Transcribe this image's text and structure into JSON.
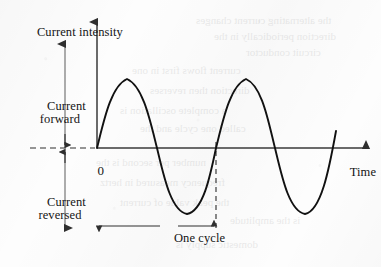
{
  "figure": {
    "title_axis_y": "Current\nintensity",
    "axis_x_label": "Time",
    "origin_label": "0",
    "region_forward": "Current\nforward",
    "region_reversed": "Current\nreversed",
    "cycle_label": "One cycle",
    "ink_color": "#141414",
    "axis_color": "#3a3a3a",
    "curve_color": "#111111",
    "paper_color": "#fdfdfd"
  },
  "chart_data": {
    "type": "line",
    "title": "Current intensity",
    "xlabel": "Time",
    "ylabel": "Current intensity",
    "x": [
      0,
      0.125,
      0.25,
      0.375,
      0.5,
      0.625,
      0.75,
      0.875,
      1.0,
      1.125,
      1.25,
      1.375,
      1.5,
      1.625,
      1.75,
      1.875,
      2.0
    ],
    "series": [
      {
        "name": "alternating current",
        "values": [
          0,
          0.707,
          1.0,
          0.707,
          0,
          -0.707,
          -1.0,
          -0.707,
          0,
          0.707,
          1.0,
          0.707,
          0,
          -0.707,
          -1.0,
          -0.707,
          0
        ]
      }
    ],
    "ylim": [
      -1.25,
      1.25
    ],
    "xlim": [
      0,
      2.05
    ],
    "grid": false,
    "legend": "none",
    "annotations": [
      {
        "text": "Current forward",
        "region": "above-axis"
      },
      {
        "text": "Current reversed",
        "region": "below-axis"
      },
      {
        "text": "One cycle",
        "from_x": 0,
        "to_x": 1.0
      },
      {
        "text": "0",
        "at": "origin"
      },
      {
        "text": "Time",
        "at": "x-axis-end"
      }
    ]
  },
  "ghost": {
    "lines": [
      {
        "text": "the alternating current changes",
        "x": 196,
        "y": 14
      },
      {
        "text": "direction periodically in the",
        "x": 214,
        "y": 30
      },
      {
        "text": "circuit conductor",
        "x": 246,
        "y": 46
      },
      {
        "text": "current flows first in one",
        "x": 132,
        "y": 64
      },
      {
        "text": "direction then reverses",
        "x": 150,
        "y": 84
      },
      {
        "text": "a complete oscillation is",
        "x": 120,
        "y": 104
      },
      {
        "text": "called one cycle and the",
        "x": 140,
        "y": 122
      },
      {
        "text": "number per second is the",
        "x": 96,
        "y": 156
      },
      {
        "text": "frequency measured in hertz",
        "x": 100,
        "y": 176
      },
      {
        "text": "the peak value of current",
        "x": 120,
        "y": 196
      },
      {
        "text": "is the amplitude",
        "x": 230,
        "y": 214
      },
      {
        "text": "domestic supply is",
        "x": 176,
        "y": 238
      }
    ]
  }
}
